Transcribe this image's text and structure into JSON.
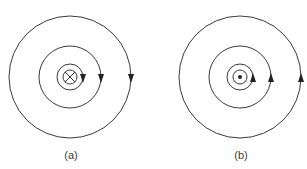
{
  "figure": {
    "line_color": "#3a3a3a",
    "panels": [
      {
        "label": "(a)",
        "current_symbol": "cross (current into page)",
        "field_direction": "clockwise",
        "center": [
          70,
          77
        ],
        "radii": [
          61,
          31,
          13
        ],
        "wire_radius": 7
      },
      {
        "label": "(b)",
        "current_symbol": "dot (current out of page)",
        "field_direction": "counterclockwise",
        "center": [
          240,
          77
        ],
        "radii": [
          61,
          31,
          13
        ],
        "wire_radius": 7
      }
    ]
  }
}
